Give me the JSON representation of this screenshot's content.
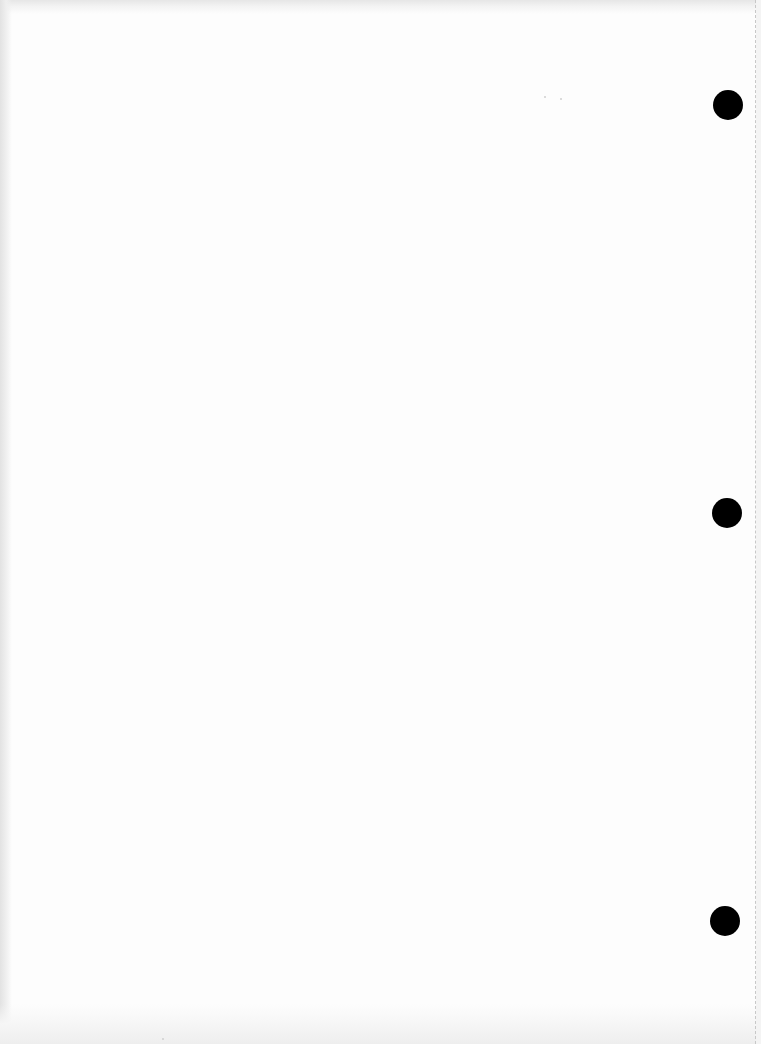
{
  "document": {
    "type": "blank scanned page",
    "text_content": "",
    "punch_holes": [
      {
        "label": "top",
        "x": 728,
        "y": 105
      },
      {
        "label": "middle",
        "x": 727,
        "y": 513
      },
      {
        "label": "bottom",
        "x": 725,
        "y": 921
      }
    ],
    "colors": {
      "paper": "#fdfdfd",
      "hole": "#000000",
      "edge_shade": "#e4e4e4",
      "perforation": "#c8c8c8"
    }
  }
}
